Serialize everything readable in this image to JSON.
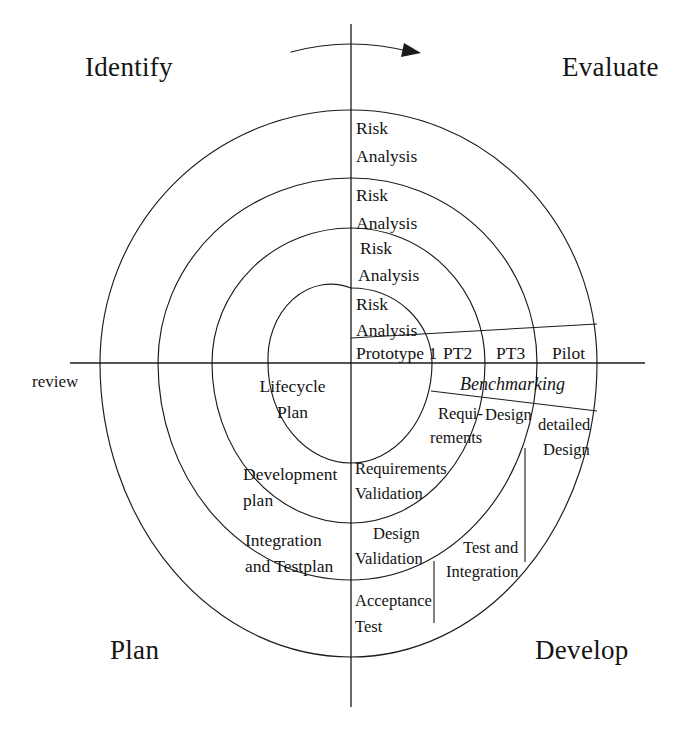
{
  "diagram": {
    "quadrant_labels": [
      {
        "name": "identify",
        "text": "Identify"
      },
      {
        "name": "evaluate",
        "text": "Evaluate"
      },
      {
        "name": "plan",
        "text": "Plan"
      },
      {
        "name": "develop",
        "text": "Develop"
      }
    ],
    "axis_labels": [
      {
        "name": "review",
        "text": "review"
      }
    ],
    "risk_analysis_labels": [
      {
        "line1": "Risk",
        "line2": "Analysis"
      },
      {
        "line1": "Risk",
        "line2": "Analysis"
      },
      {
        "line1": "Risk",
        "line2": "Analysis"
      },
      {
        "line1": "Risk",
        "line2": "Analysis"
      }
    ],
    "prototype_labels": [
      {
        "name": "prototype-1",
        "text": "Prototype 1"
      },
      {
        "name": "pt2",
        "text": "PT2"
      },
      {
        "name": "pt3",
        "text": "PT3"
      },
      {
        "name": "pilot",
        "text": "Pilot"
      }
    ],
    "plan_labels": [
      {
        "name": "lifecycle-plan",
        "line1": "Lifecycle",
        "line2": "Plan"
      },
      {
        "name": "development-plan",
        "line1": "Development",
        "line2": "plan"
      },
      {
        "name": "integration-and-testplan",
        "line1": "Integration",
        "line2": "and Testplan"
      }
    ],
    "validation_labels": [
      {
        "name": "requirements-validation",
        "line1": "Requirements",
        "line2": "Validation"
      },
      {
        "name": "design-validation",
        "line1": "Design",
        "line2": "Validation"
      },
      {
        "name": "acceptance-test",
        "line1": "Acceptance",
        "line2": "Test"
      }
    ],
    "develop_labels": [
      {
        "name": "benchmarking",
        "text": "Benchmarking"
      },
      {
        "name": "requirements",
        "line1": "Requi-",
        "line2": "rements"
      },
      {
        "name": "design",
        "text": "Design"
      },
      {
        "name": "detailed-design",
        "line1": "detailed",
        "line2": "Design"
      },
      {
        "name": "test-and-integration",
        "line1": "Test and",
        "line2": "Integration"
      }
    ],
    "icons": [
      {
        "name": "rotation-arrow-icon",
        "meaning": "clockwise progression arrow"
      }
    ],
    "colors": {
      "stroke": "#1b1b1b",
      "background": "#ffffff",
      "text": "#141414"
    }
  }
}
